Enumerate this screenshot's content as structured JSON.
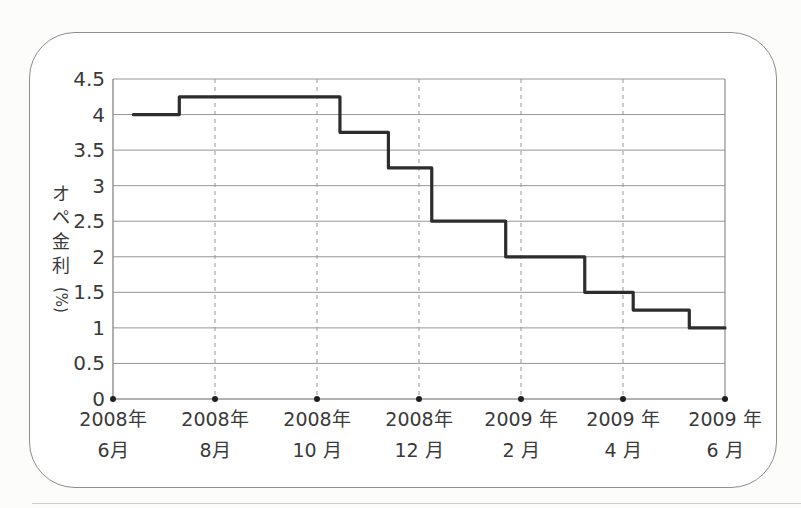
{
  "panel": {
    "background": "#ffffff",
    "border_color": "#8d8d8d"
  },
  "chart_data": {
    "type": "line",
    "line_style": "step",
    "title": "",
    "ylabel": "オペ金利(%)",
    "ylabel_chars": [
      "オ",
      "ペ",
      "金",
      "利"
    ],
    "ylabel_unit": "(%)",
    "xlabel": "",
    "ylim": [
      0,
      4.5
    ],
    "y_ticks": [
      "0",
      "0.5",
      "1",
      "1.5",
      "2",
      "2.5",
      "3",
      "3.5",
      "4",
      "4.5"
    ],
    "y_tick_values": [
      0,
      0.5,
      1,
      1.5,
      2,
      2.5,
      3,
      3.5,
      4,
      4.5
    ],
    "x_ticks": [
      {
        "line1": "2008年",
        "line2": "6月"
      },
      {
        "line1": "2008年",
        "line2": "8月"
      },
      {
        "line1": "2008年",
        "line2": "10 月"
      },
      {
        "line1": "2008年",
        "line2": "12 月"
      },
      {
        "line1": "2009 年",
        "line2": "2 月"
      },
      {
        "line1": "2009 年",
        "line2": "4 月"
      },
      {
        "line1": "2009 年",
        "line2": "6 月"
      }
    ],
    "x_tick_month_offsets": [
      0,
      2,
      4,
      6,
      8,
      10,
      12
    ],
    "x_range_months": [
      0,
      12
    ],
    "grid": {
      "horizontal": "solid",
      "vertical": "dashed",
      "legend": "none"
    },
    "series": [
      {
        "name": "オペ金利",
        "color": "#2d2d2d",
        "step_points": [
          {
            "month": 0.4,
            "rate": 4.0
          },
          {
            "month": 1.3,
            "rate": 4.25
          },
          {
            "month": 4.45,
            "rate": 3.75
          },
          {
            "month": 5.4,
            "rate": 3.25
          },
          {
            "month": 6.25,
            "rate": 2.5
          },
          {
            "month": 7.7,
            "rate": 2.0
          },
          {
            "month": 9.25,
            "rate": 1.5
          },
          {
            "month": 10.2,
            "rate": 1.25
          },
          {
            "month": 11.3,
            "rate": 1.0
          }
        ],
        "end_month": 12
      }
    ],
    "colors": {
      "grid": "#979797",
      "axis": "#8f8f8f",
      "tick_dot": "#1f1f1f",
      "label": "#3a3a3a"
    }
  }
}
